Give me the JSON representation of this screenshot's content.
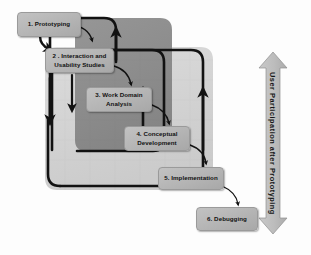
{
  "diagram": {
    "background_color": "#fdfdfd",
    "panels": [
      {
        "name": "outer-panel",
        "label": "outer light gray loop region",
        "color": "#d2d2d2"
      },
      {
        "name": "inner-panel",
        "label": "inner dark gray loop region",
        "color": "#8c8c8c"
      }
    ],
    "stages": [
      {
        "id": "stage-1",
        "label": "1. Prototyping"
      },
      {
        "id": "stage-2",
        "label": "2 . Interaction and Usability Studies"
      },
      {
        "id": "stage-3",
        "label": "3. Work Domain Analysis"
      },
      {
        "id": "stage-4",
        "label": "4. Conceptual Development"
      },
      {
        "id": "stage-5",
        "label": "5. Implementation"
      },
      {
        "id": "stage-6",
        "label": "6. Debugging"
      }
    ],
    "side_arrow": {
      "label": "User Participation  after  Prototyping",
      "direction": "double-headed-vertical",
      "color": "#b9b9b9"
    },
    "colors": {
      "box_fill": "#b4b4b4",
      "outer_panel": "#d2d2d2",
      "inner_panel": "#8c8c8c",
      "stroke": "#121212",
      "text": "#111111"
    }
  }
}
